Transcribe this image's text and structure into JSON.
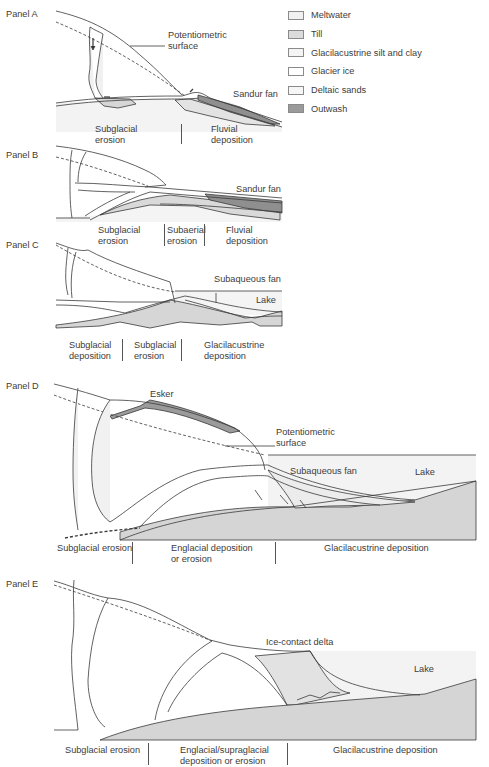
{
  "legend": {
    "items": [
      {
        "label": "Meltwater",
        "color": "#f1f1f1"
      },
      {
        "label": "Till",
        "color": "#dcdcdc"
      },
      {
        "label": "Glacilacustrine silt and clay",
        "color": "#f4f4f4"
      },
      {
        "label": "Glacier ice",
        "color": "#ffffff"
      },
      {
        "label": "Deltaic sands",
        "color": "#f6f6f6"
      },
      {
        "label": "Outwash",
        "color": "#9a9a9a"
      }
    ]
  },
  "panels": {
    "a": {
      "title": "Panel A",
      "labels": {
        "potentiometric": "Potentiometric\nsurface",
        "sandur": "Sandur fan"
      },
      "zones": [
        "Subglacial\nerosion",
        "Fluvial\ndeposition"
      ]
    },
    "b": {
      "title": "Panel B",
      "labels": {
        "sandur": "Sandur fan"
      },
      "zones": [
        "Subglacial\nerosion",
        "Subaerial\nerosion",
        "Fluvial\ndeposition"
      ]
    },
    "c": {
      "title": "Panel C",
      "labels": {
        "subaqueous": "Subaqueous fan",
        "lake": "Lake"
      },
      "zones": [
        "Subglacial\ndeposition",
        "Subglacial\nerosion",
        "Glacilacustrine\ndeposition"
      ]
    },
    "d": {
      "title": "Panel D",
      "labels": {
        "esker": "Esker",
        "potentiometric": "Potentiometric\nsurface",
        "subaqueous": "Subaqueous fan",
        "lake": "Lake"
      },
      "zones": [
        "Subglacial erosion",
        "Englacial deposition\nor erosion",
        "Glacilacustrine deposition"
      ]
    },
    "e": {
      "title": "Panel E",
      "labels": {
        "delta": "Ice-contact delta",
        "lake": "Lake"
      },
      "zones": [
        "Subglacial erosion",
        "Englacial/supraglacial\ndeposition or erosion",
        "Glacilacustrine deposition"
      ]
    }
  },
  "colors": {
    "line": "#3a3a3a",
    "meltwater": "#f1f1f1",
    "till": "#d6d6d6",
    "lake": "#f2f2f2",
    "outwash": "#8f8f8f",
    "esker": "#9b9b9b"
  }
}
